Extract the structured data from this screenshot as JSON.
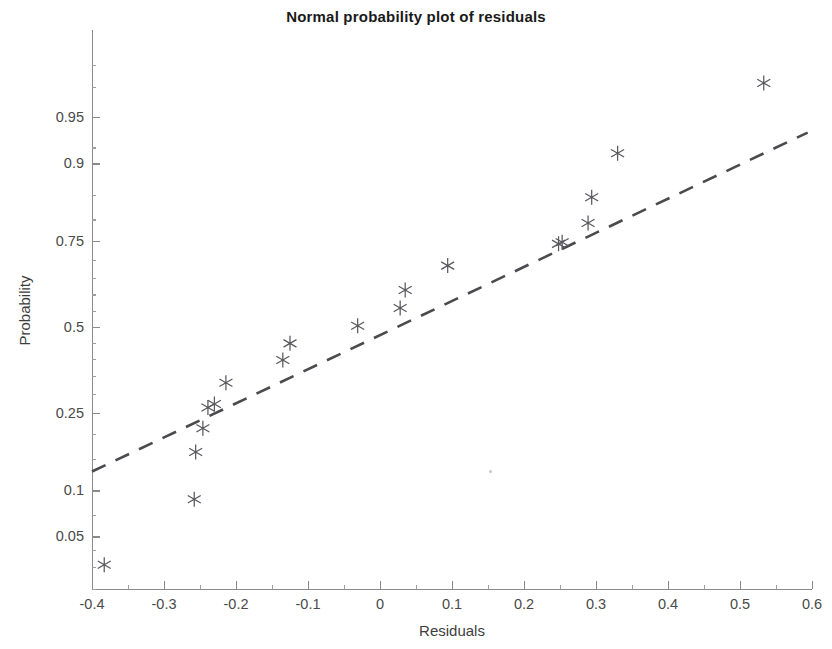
{
  "chart_data": {
    "type": "scatter",
    "title": "Normal probability plot of residuals",
    "xlabel": "Residuals",
    "ylabel": "Probability",
    "xlim": [
      -0.4,
      0.6
    ],
    "ylim_probability": [
      0.02,
      0.99
    ],
    "grid": false,
    "legend": null,
    "x_ticks": [
      -0.4,
      -0.3,
      -0.2,
      -0.1,
      0,
      0.1,
      0.2,
      0.3,
      0.4,
      0.5,
      0.6
    ],
    "x_tick_labels": [
      "-0.4",
      "-0.3",
      "-0.2",
      "-0.1",
      "0",
      "0.1",
      "0.2",
      "0.3",
      "0.4",
      "0.5",
      "0.6"
    ],
    "y_ticks": [
      0.05,
      0.1,
      0.25,
      0.5,
      0.75,
      0.9,
      0.95
    ],
    "y_tick_labels": [
      "0.05",
      "0.1",
      "0.25",
      "0.5",
      "0.75",
      "0.9",
      "0.95"
    ],
    "marker_style": "six-pointed asterisk",
    "marker_color": "#59595e",
    "reference_line": {
      "style": "dashed",
      "color": "#4a4a4f",
      "x_start": -0.4,
      "y_start": 0.128,
      "x_end": 0.594,
      "y_end": 0.936
    },
    "points": [
      {
        "x": -0.383,
        "y": 0.031
      },
      {
        "x": -0.258,
        "y": 0.088
      },
      {
        "x": -0.256,
        "y": 0.163
      },
      {
        "x": -0.246,
        "y": 0.213
      },
      {
        "x": -0.239,
        "y": 0.263
      },
      {
        "x": -0.23,
        "y": 0.272
      },
      {
        "x": -0.214,
        "y": 0.33
      },
      {
        "x": -0.135,
        "y": 0.397
      },
      {
        "x": -0.125,
        "y": 0.448
      },
      {
        "x": -0.031,
        "y": 0.503
      },
      {
        "x": 0.028,
        "y": 0.558
      },
      {
        "x": 0.035,
        "y": 0.613
      },
      {
        "x": 0.094,
        "y": 0.684
      },
      {
        "x": 0.248,
        "y": 0.742
      },
      {
        "x": 0.253,
        "y": 0.746
      },
      {
        "x": 0.289,
        "y": 0.792
      },
      {
        "x": 0.294,
        "y": 0.845
      },
      {
        "x": 0.33,
        "y": 0.913
      },
      {
        "x": 0.533,
        "y": 0.972
      }
    ],
    "n_points": 19
  },
  "figure": {
    "background": "#ffffff",
    "axis_color": "#8a8a8a",
    "text_color": "#3d3d3d"
  }
}
